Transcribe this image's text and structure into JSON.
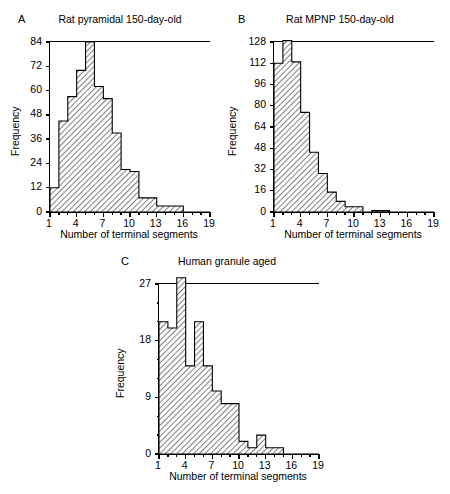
{
  "figure": {
    "axis_x_label": "Number of terminal segments",
    "axis_y_label": "Frequency"
  },
  "panels": [
    {
      "letter": "A",
      "title": "Rat pyramidal 150-day-old",
      "xlabel": "Number of terminal segments",
      "ylabel": "Frequency",
      "xticklabels": [
        "1",
        "4",
        "7",
        "10",
        "13",
        "16",
        "19"
      ],
      "yticklabels": [
        "84",
        "72",
        "60",
        "48",
        "36",
        "24",
        "12",
        "0"
      ]
    },
    {
      "letter": "B",
      "title": "Rat MPNP 150-day-old",
      "xlabel": "Number of terminal segments",
      "ylabel": "Frequency",
      "xticklabels": [
        "1",
        "4",
        "7",
        "10",
        "13",
        "16",
        "19"
      ],
      "yticklabels": [
        "128",
        "112",
        "96",
        "80",
        "64",
        "48",
        "32",
        "16",
        "0"
      ]
    },
    {
      "letter": "C",
      "title": "Human granule aged",
      "xlabel": "Number of terminal segments",
      "ylabel": "Frequency",
      "xticklabels": [
        "1",
        "4",
        "7",
        "10",
        "13",
        "16",
        "19"
      ],
      "yticklabels": [
        "27",
        "18",
        "9",
        "0"
      ]
    }
  ],
  "chart_data": [
    {
      "type": "bar",
      "panel": "A",
      "title": "Rat pyramidal 150-day-old",
      "xlabel": "Number of terminal segments",
      "ylabel": "Frequency",
      "xlim": [
        1,
        19
      ],
      "ylim": [
        0,
        84
      ],
      "yticks": [
        0,
        12,
        24,
        36,
        48,
        60,
        72,
        84
      ],
      "xticks": [
        1,
        4,
        7,
        10,
        13,
        16,
        19
      ],
      "xminorticks": [
        1,
        2,
        3,
        4,
        5,
        6,
        7,
        8,
        9,
        10,
        11,
        12,
        13,
        14,
        15,
        16,
        17,
        18,
        19
      ],
      "grid": false,
      "legend": "none",
      "categories": [
        1,
        2,
        3,
        4,
        5,
        6,
        7,
        8,
        9,
        10,
        11,
        12,
        13,
        14,
        15,
        16,
        17,
        18
      ],
      "values": [
        12,
        45,
        57,
        70,
        84,
        62,
        56,
        39,
        21,
        20,
        7,
        7,
        3,
        3,
        3,
        0,
        0,
        0
      ]
    },
    {
      "type": "bar",
      "panel": "B",
      "title": "Rat MPNP 150-day-old",
      "xlabel": "Number of terminal segments",
      "ylabel": "Frequency",
      "xlim": [
        1,
        19
      ],
      "ylim": [
        0,
        128
      ],
      "yticks": [
        0,
        16,
        32,
        48,
        64,
        80,
        96,
        112,
        128
      ],
      "xticks": [
        1,
        4,
        7,
        10,
        13,
        16,
        19
      ],
      "xminorticks": [
        1,
        2,
        3,
        4,
        5,
        6,
        7,
        8,
        9,
        10,
        11,
        12,
        13,
        14,
        15,
        16,
        17,
        18,
        19
      ],
      "grid": false,
      "legend": "none",
      "categories": [
        1,
        2,
        3,
        4,
        5,
        6,
        7,
        8,
        9,
        10,
        11,
        12,
        13,
        14,
        15,
        16,
        17,
        18
      ],
      "values": [
        112,
        129,
        113,
        75,
        45,
        29,
        15,
        8,
        4,
        4,
        0,
        1,
        1,
        0,
        0,
        0,
        0,
        0
      ]
    },
    {
      "type": "bar",
      "panel": "C",
      "title": "Human granule aged",
      "xlabel": "Number of terminal segments",
      "ylabel": "Frequency",
      "xlim": [
        1,
        19
      ],
      "ylim": [
        0,
        27
      ],
      "yticks": [
        0,
        9,
        18,
        27
      ],
      "xticks": [
        1,
        4,
        7,
        10,
        13,
        16,
        19
      ],
      "xminorticks": [
        1,
        2,
        3,
        4,
        5,
        6,
        7,
        8,
        9,
        10,
        11,
        12,
        13,
        14,
        15,
        16,
        17,
        18,
        19
      ],
      "grid": false,
      "legend": "none",
      "categories": [
        1,
        2,
        3,
        4,
        5,
        6,
        7,
        8,
        9,
        10,
        11,
        12,
        13,
        14,
        15,
        16,
        17,
        18
      ],
      "values": [
        21,
        20,
        28,
        14,
        21,
        14,
        10,
        8,
        8,
        2,
        1,
        3,
        1,
        1,
        0,
        0,
        0,
        0
      ]
    }
  ],
  "style": {
    "bar_fill": "#d9d9d9",
    "bar_stroke": "#000000",
    "hatch_color": "#555555",
    "axis_color": "#000000"
  }
}
